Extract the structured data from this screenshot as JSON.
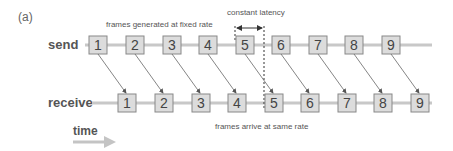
{
  "figure_label": "(a)",
  "rows": {
    "send": {
      "label": "send",
      "frames": [
        "1",
        "2",
        "3",
        "4",
        "5",
        "6",
        "7",
        "8",
        "9"
      ]
    },
    "receive": {
      "label": "receive",
      "frames": [
        "1",
        "2",
        "3",
        "4",
        "5",
        "6",
        "7",
        "8",
        "9"
      ]
    }
  },
  "annotations": {
    "top": "frames generated at fixed rate",
    "latency": "constant latency",
    "bottom": "frames arrive at same rate"
  },
  "time_label": "time",
  "colors": {
    "box_fill": "#dcdcdc",
    "box_stroke": "#888888",
    "line": "#c8c8c8",
    "arrow": "#666666",
    "time_arrow": "#c4c4c4"
  }
}
